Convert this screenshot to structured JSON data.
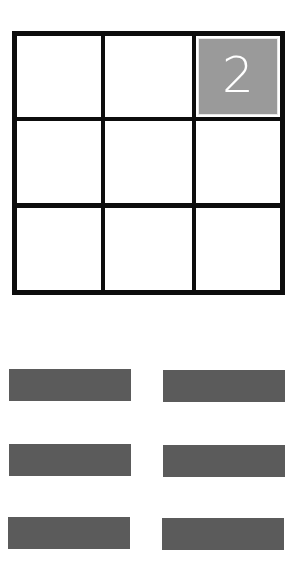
{
  "board": {
    "rows": 3,
    "cols": 3,
    "cells": [
      [
        {
          "value": ""
        },
        {
          "value": ""
        },
        {
          "value": "2",
          "tile": true
        }
      ],
      [
        {
          "value": ""
        },
        {
          "value": ""
        },
        {
          "value": ""
        }
      ],
      [
        {
          "value": ""
        },
        {
          "value": ""
        },
        {
          "value": ""
        }
      ]
    ],
    "line_color": "#0d0d0d",
    "tile_color": "#9a9a9a",
    "tile_text_color": "#ffffff"
  },
  "controls": {
    "bar_color": "#5b5b5b",
    "bars": [
      {
        "row": 1,
        "col": 1
      },
      {
        "row": 1,
        "col": 2
      },
      {
        "row": 2,
        "col": 1
      },
      {
        "row": 2,
        "col": 2
      },
      {
        "row": 3,
        "col": 1
      },
      {
        "row": 3,
        "col": 2
      }
    ]
  }
}
